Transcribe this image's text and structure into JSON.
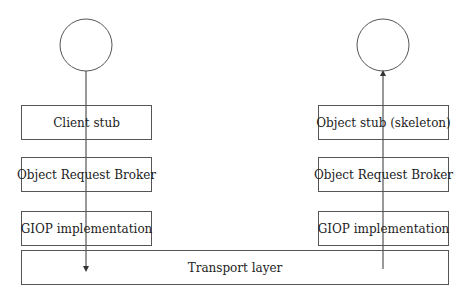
{
  "diagram": {
    "type": "layered-architecture",
    "client_side": {
      "endpoint": "circle",
      "layers": [
        {
          "label": "Client stub"
        },
        {
          "label": "Object Request Broker"
        },
        {
          "label": "GIOP implementation"
        }
      ],
      "arrow_direction": "down"
    },
    "server_side": {
      "endpoint": "circle",
      "layers": [
        {
          "label": "Object stub (skeleton)"
        },
        {
          "label": "Object Request Broker"
        },
        {
          "label": "GIOP implementation"
        }
      ],
      "arrow_direction": "up"
    },
    "shared_layer": {
      "label": "Transport layer"
    },
    "colors": {
      "stroke": "#555555",
      "text": "#222222",
      "background": "#ffffff"
    }
  }
}
